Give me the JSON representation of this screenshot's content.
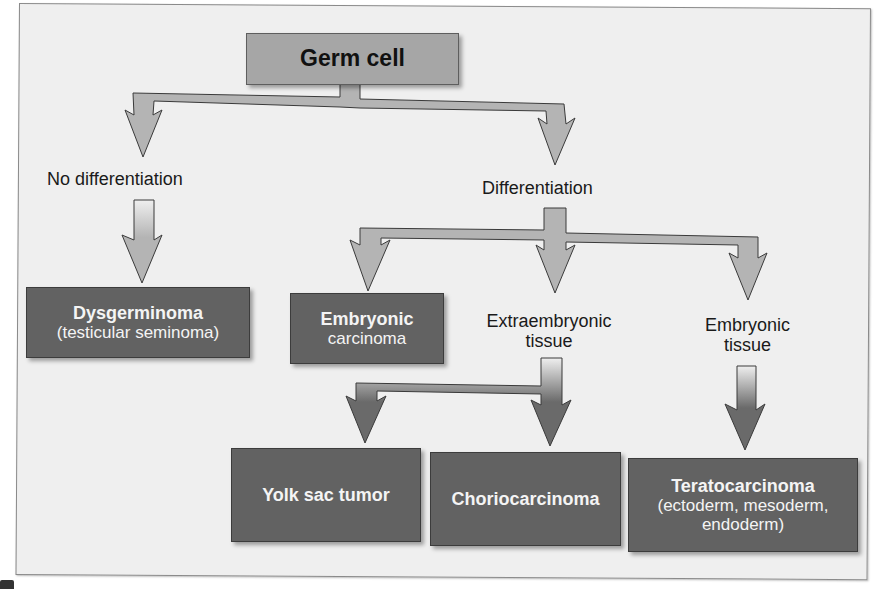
{
  "diagram": {
    "title": "Germ cell",
    "root": {
      "label": "Germ cell"
    },
    "branches": [
      {
        "label": "No differentiation",
        "outcome": {
          "title": "Dysgerminoma",
          "subtitle": "(testicular seminoma)"
        }
      },
      {
        "label": "Differentiation",
        "children": [
          {
            "outcome": {
              "title": "Embryonic",
              "subtitle": "carcinoma"
            }
          },
          {
            "label_line1": "Extraembryonic",
            "label_line2": "tissue",
            "outcomes": [
              {
                "title": "Yolk sac tumor"
              },
              {
                "title": "Choriocarcinoma"
              }
            ]
          },
          {
            "label_line1": "Embryonic",
            "label_line2": "tissue",
            "outcome": {
              "title": "Teratocarcinoma",
              "line2": "(ectoderm, mesoderm,",
              "line3": "endoderm)"
            }
          }
        ]
      }
    ]
  },
  "colors": {
    "background": "#efefef",
    "root_box": "#a6a6a6",
    "outcome_box": "#626262",
    "arrow_light": "#b4b4b4",
    "arrow_dark": "#6a6a6a",
    "outline": "#3a3a3a"
  }
}
